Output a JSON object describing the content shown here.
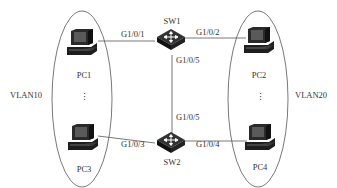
{
  "diagram": {
    "switches": [
      {
        "id": "sw1",
        "label": "SW1"
      },
      {
        "id": "sw2",
        "label": "SW2"
      }
    ],
    "pcs": [
      {
        "id": "pc1",
        "label": "PC1"
      },
      {
        "id": "pc2",
        "label": "PC2"
      },
      {
        "id": "pc3",
        "label": "PC3"
      },
      {
        "id": "pc4",
        "label": "PC4"
      }
    ],
    "ports": {
      "sw1_pc1": "G1/0/1",
      "sw1_pc2": "G1/0/2",
      "sw1_sw2": "G1/0/5",
      "sw2_sw1": "G1/0/5",
      "sw2_pc3": "G1/0/3",
      "sw2_pc4": "G1/0/4"
    },
    "vlans": [
      {
        "id": "vlan10",
        "label": "VLAN10"
      },
      {
        "id": "vlan20",
        "label": "VLAN20"
      }
    ],
    "ellipsis": "⋮",
    "colors": {
      "line": "#555555",
      "device": "#222222",
      "text": "#333333"
    }
  }
}
